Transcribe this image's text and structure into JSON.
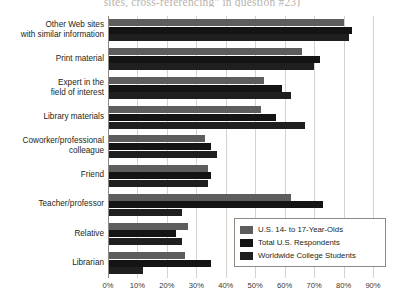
{
  "chart_data": {
    "type": "bar",
    "orientation": "horizontal",
    "title": "sites, cross-referencing\" in question #23)",
    "xlabel": "",
    "ylabel": "",
    "xlim": [
      0,
      90
    ],
    "xticks": [
      "0%",
      "10%",
      "20%",
      "30%",
      "40%",
      "50%",
      "60%",
      "70%",
      "80%",
      "90%"
    ],
    "xtick_values": [
      0,
      10,
      20,
      30,
      40,
      50,
      60,
      70,
      80,
      90
    ],
    "grid": true,
    "legend_position": "bottom-right",
    "categories": [
      "Other Web sites with similar information",
      "Print material",
      "Expert in the field of interest",
      "Library materials",
      "Coworker/professional colleague",
      "Friend",
      "Teacher/professor",
      "Relative",
      "Librarian"
    ],
    "category_lines": [
      [
        "Other Web sites",
        "with similar information"
      ],
      [
        "Print material"
      ],
      [
        "Expert in the",
        "field of interest"
      ],
      [
        "Library materials"
      ],
      [
        "Coworker/professional",
        "colleague"
      ],
      [
        "Friend"
      ],
      [
        "Teacher/professor"
      ],
      [
        "Relative"
      ],
      [
        "Librarian"
      ]
    ],
    "series": [
      {
        "name": "U.S. 14- to 17-Year-Olds",
        "color": "#5d5d5d",
        "values": [
          80,
          66,
          53,
          52,
          33,
          34,
          62,
          27,
          26
        ]
      },
      {
        "name": "Total U.S. Respondents",
        "color": "#141414",
        "values": [
          83,
          72,
          59,
          57,
          35,
          35,
          73,
          23,
          35
        ]
      },
      {
        "name": "Worldwide College Students",
        "color": "#1f1f1f",
        "values": [
          82,
          70,
          62,
          67,
          37,
          34,
          25,
          25,
          12
        ]
      }
    ]
  },
  "legend": {
    "items": [
      {
        "label": "U.S. 14- to 17-Year-Olds",
        "color": "#5d5d5d"
      },
      {
        "label": "Total U.S. Respondents",
        "color": "#141414"
      },
      {
        "label": "Worldwide College Students",
        "color": "#1f1f1f"
      }
    ]
  },
  "colors": {
    "gridline": "#d6d2cd",
    "axis": "#8d8884",
    "text": "#231f20",
    "background": "#ffffff"
  }
}
